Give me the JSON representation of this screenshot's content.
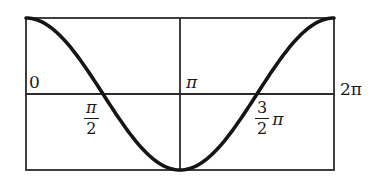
{
  "diagram": {
    "type": "cosine-graph",
    "function": "y = cos x",
    "domain": [
      0,
      "2π"
    ],
    "colors": {
      "frame": "#2b2b2b",
      "curve": "#151515",
      "text": "#1a1a1a",
      "background": "#ffffff"
    },
    "labels": {
      "origin": "0",
      "pi": "π",
      "two_pi": "2π",
      "half_pi": {
        "numerator": "π",
        "denominator": "2",
        "suffix": ""
      },
      "three_half_pi": {
        "numerator": "3",
        "denominator": "2",
        "suffix": "π"
      }
    }
  },
  "chart_data": {
    "type": "line",
    "title": "",
    "xlabel": "",
    "ylabel": "",
    "x_ticks": [
      "0",
      "π/2",
      "π",
      "3π/2",
      "2π"
    ],
    "series": [
      {
        "name": "cos x",
        "x": [
          "0",
          "π/2",
          "π",
          "3π/2",
          "2π"
        ],
        "values": [
          1,
          0,
          -1,
          0,
          1
        ]
      }
    ],
    "xlim": [
      0,
      "2π"
    ],
    "ylim": [
      -1,
      1
    ],
    "grid": false,
    "legend": "none"
  }
}
